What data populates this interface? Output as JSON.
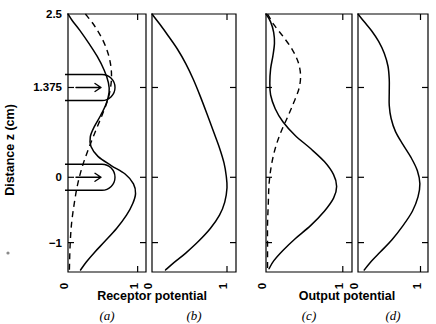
{
  "figure": {
    "y_axis_title": "Distance z (cm)",
    "y_ticks": [
      {
        "label": "2.5",
        "value": 2.5
      },
      {
        "label": "1.375",
        "value": 1.375
      },
      {
        "label": "0",
        "value": 0
      },
      {
        "label": "−1",
        "value": -1
      }
    ],
    "x_ticks": [
      {
        "label": "0",
        "value": 0
      },
      {
        "label": "1",
        "value": 1
      }
    ],
    "group_titles": [
      {
        "label": "Receptor potential",
        "panels": [
          "a",
          "b"
        ]
      },
      {
        "label": "Output potential",
        "panels": [
          "c",
          "d"
        ]
      }
    ],
    "panel_labels": [
      "(a)",
      "(b)",
      "(c)",
      "(d)"
    ],
    "line_color": "#000000",
    "background_color": "#ffffff"
  },
  "chart_data": {
    "type": "line",
    "title": "",
    "subtitle": "",
    "xlabel": "Receptor potential / Output potential",
    "ylabel": "Distance z (cm)",
    "xlim": [
      0,
      1.12
    ],
    "ylim": [
      -1.45,
      2.5
    ],
    "grid": false,
    "legend": "none",
    "orientation": "horizontal-value-vertical-distance",
    "x_tick_values": [
      0,
      1
    ],
    "y_tick_values": [
      2.5,
      1.375,
      0,
      -1
    ],
    "panels": [
      {
        "id": "a",
        "label": "(a)",
        "xlabel": "Receptor potential",
        "series": [
          {
            "name": "receptor-profile-solid",
            "style": "solid",
            "points": [
              {
                "v": 0.0,
                "z": 2.5
              },
              {
                "v": 0.06,
                "z": 2.4
              },
              {
                "v": 0.17,
                "z": 2.25
              },
              {
                "v": 0.3,
                "z": 2.05
              },
              {
                "v": 0.42,
                "z": 1.85
              },
              {
                "v": 0.52,
                "z": 1.64
              },
              {
                "v": 0.58,
                "z": 1.45
              },
              {
                "v": 0.59,
                "z": 1.3
              },
              {
                "v": 0.55,
                "z": 1.13
              },
              {
                "v": 0.47,
                "z": 0.95
              },
              {
                "v": 0.38,
                "z": 0.78
              },
              {
                "v": 0.32,
                "z": 0.62
              },
              {
                "v": 0.33,
                "z": 0.47
              },
              {
                "v": 0.43,
                "z": 0.32
              },
              {
                "v": 0.62,
                "z": 0.18
              },
              {
                "v": 0.82,
                "z": 0.05
              },
              {
                "v": 0.94,
                "z": -0.1
              },
              {
                "v": 0.97,
                "z": -0.25
              },
              {
                "v": 0.93,
                "z": -0.4
              },
              {
                "v": 0.84,
                "z": -0.58
              },
              {
                "v": 0.7,
                "z": -0.78
              },
              {
                "v": 0.53,
                "z": -0.98
              },
              {
                "v": 0.38,
                "z": -1.15
              },
              {
                "v": 0.26,
                "z": -1.3
              },
              {
                "v": 0.18,
                "z": -1.42
              }
            ]
          },
          {
            "name": "receptor-profile-dashed",
            "style": "dashed",
            "points": [
              {
                "v": 0.25,
                "z": 2.5
              },
              {
                "v": 0.38,
                "z": 2.32
              },
              {
                "v": 0.5,
                "z": 2.1
              },
              {
                "v": 0.58,
                "z": 1.88
              },
              {
                "v": 0.62,
                "z": 1.66
              },
              {
                "v": 0.62,
                "z": 1.45
              },
              {
                "v": 0.58,
                "z": 1.22
              },
              {
                "v": 0.5,
                "z": 0.98
              },
              {
                "v": 0.4,
                "z": 0.72
              },
              {
                "v": 0.3,
                "z": 0.45
              },
              {
                "v": 0.21,
                "z": 0.18
              },
              {
                "v": 0.14,
                "z": -0.1
              },
              {
                "v": 0.09,
                "z": -0.4
              },
              {
                "v": 0.05,
                "z": -0.72
              },
              {
                "v": 0.03,
                "z": -1.05
              },
              {
                "v": 0.02,
                "z": -1.42
              }
            ]
          }
        ],
        "annotations": [
          {
            "type": "arrow-box",
            "z": 1.375,
            "direction": "right"
          },
          {
            "type": "arrow-box",
            "z": 0.0,
            "direction": "right"
          }
        ]
      },
      {
        "id": "b",
        "label": "(b)",
        "xlabel": "Receptor potential",
        "series": [
          {
            "name": "receptor-profile-solid",
            "style": "solid",
            "points": [
              {
                "v": 0.0,
                "z": 2.5
              },
              {
                "v": 0.1,
                "z": 2.35
              },
              {
                "v": 0.22,
                "z": 2.16
              },
              {
                "v": 0.34,
                "z": 1.96
              },
              {
                "v": 0.45,
                "z": 1.74
              },
              {
                "v": 0.55,
                "z": 1.5
              },
              {
                "v": 0.64,
                "z": 1.25
              },
              {
                "v": 0.73,
                "z": 0.98
              },
              {
                "v": 0.82,
                "z": 0.7
              },
              {
                "v": 0.9,
                "z": 0.45
              },
              {
                "v": 0.96,
                "z": 0.22
              },
              {
                "v": 0.99,
                "z": 0.02
              },
              {
                "v": 1.0,
                "z": -0.16
              },
              {
                "v": 0.97,
                "z": -0.38
              },
              {
                "v": 0.9,
                "z": -0.58
              },
              {
                "v": 0.78,
                "z": -0.78
              },
              {
                "v": 0.62,
                "z": -0.98
              },
              {
                "v": 0.45,
                "z": -1.16
              },
              {
                "v": 0.3,
                "z": -1.3
              },
              {
                "v": 0.18,
                "z": -1.42
              }
            ]
          }
        ],
        "annotations": []
      },
      {
        "id": "c",
        "label": "(c)",
        "xlabel": "Output potential",
        "series": [
          {
            "name": "output-profile-solid",
            "style": "solid",
            "points": [
              {
                "v": 0.0,
                "z": 2.5
              },
              {
                "v": 0.06,
                "z": 2.38
              },
              {
                "v": 0.1,
                "z": 2.22
              },
              {
                "v": 0.11,
                "z": 2.05
              },
              {
                "v": 0.09,
                "z": 1.86
              },
              {
                "v": 0.06,
                "z": 1.66
              },
              {
                "v": 0.05,
                "z": 1.45
              },
              {
                "v": 0.06,
                "z": 1.26
              },
              {
                "v": 0.12,
                "z": 1.05
              },
              {
                "v": 0.22,
                "z": 0.85
              },
              {
                "v": 0.38,
                "z": 0.64
              },
              {
                "v": 0.58,
                "z": 0.44
              },
              {
                "v": 0.76,
                "z": 0.24
              },
              {
                "v": 0.88,
                "z": 0.04
              },
              {
                "v": 0.92,
                "z": -0.14
              },
              {
                "v": 0.88,
                "z": -0.32
              },
              {
                "v": 0.76,
                "z": -0.52
              },
              {
                "v": 0.58,
                "z": -0.74
              },
              {
                "v": 0.38,
                "z": -0.94
              },
              {
                "v": 0.22,
                "z": -1.12
              },
              {
                "v": 0.1,
                "z": -1.28
              },
              {
                "v": 0.04,
                "z": -1.4
              }
            ]
          },
          {
            "name": "output-profile-dashed",
            "style": "dashed",
            "points": [
              {
                "v": 0.02,
                "z": 2.5
              },
              {
                "v": 0.1,
                "z": 2.34
              },
              {
                "v": 0.22,
                "z": 2.16
              },
              {
                "v": 0.34,
                "z": 1.96
              },
              {
                "v": 0.42,
                "z": 1.76
              },
              {
                "v": 0.45,
                "z": 1.56
              },
              {
                "v": 0.43,
                "z": 1.36
              },
              {
                "v": 0.36,
                "z": 1.14
              },
              {
                "v": 0.28,
                "z": 0.92
              },
              {
                "v": 0.19,
                "z": 0.68
              },
              {
                "v": 0.12,
                "z": 0.44
              },
              {
                "v": 0.07,
                "z": 0.18
              },
              {
                "v": 0.04,
                "z": -0.1
              },
              {
                "v": 0.03,
                "z": -0.4
              },
              {
                "v": 0.02,
                "z": -0.72
              },
              {
                "v": 0.02,
                "z": -1.05
              },
              {
                "v": 0.02,
                "z": -1.4
              }
            ]
          }
        ],
        "annotations": []
      },
      {
        "id": "d",
        "label": "(d)",
        "xlabel": "Output potential",
        "series": [
          {
            "name": "output-profile-solid",
            "style": "solid",
            "points": [
              {
                "v": 0.0,
                "z": 2.5
              },
              {
                "v": 0.1,
                "z": 2.38
              },
              {
                "v": 0.22,
                "z": 2.24
              },
              {
                "v": 0.33,
                "z": 2.08
              },
              {
                "v": 0.42,
                "z": 1.9
              },
              {
                "v": 0.48,
                "z": 1.7
              },
              {
                "v": 0.5,
                "z": 1.5
              },
              {
                "v": 0.5,
                "z": 1.3
              },
              {
                "v": 0.5,
                "z": 1.1
              },
              {
                "v": 0.53,
                "z": 0.9
              },
              {
                "v": 0.6,
                "z": 0.7
              },
              {
                "v": 0.72,
                "z": 0.5
              },
              {
                "v": 0.85,
                "z": 0.3
              },
              {
                "v": 0.95,
                "z": 0.1
              },
              {
                "v": 0.99,
                "z": -0.1
              },
              {
                "v": 0.96,
                "z": -0.3
              },
              {
                "v": 0.87,
                "z": -0.52
              },
              {
                "v": 0.72,
                "z": -0.74
              },
              {
                "v": 0.54,
                "z": -0.96
              },
              {
                "v": 0.36,
                "z": -1.14
              },
              {
                "v": 0.2,
                "z": -1.3
              },
              {
                "v": 0.1,
                "z": -1.42
              }
            ]
          }
        ],
        "annotations": []
      }
    ]
  }
}
